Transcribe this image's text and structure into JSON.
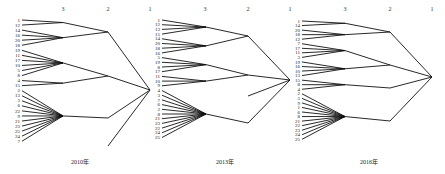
{
  "chart_data": {
    "type": "dendrogram",
    "level_labels": [
      "3",
      "2",
      "1"
    ],
    "panels": [
      {
        "caption": "2010年",
        "leaf_labels": [
          "1",
          "12",
          "14",
          "16",
          "20",
          "18",
          "19",
          "11",
          "17",
          "10",
          "5",
          "8",
          "4",
          "15",
          "2",
          "13",
          "3",
          "6",
          "22",
          "9",
          "21",
          "23",
          "25",
          "24",
          "7"
        ],
        "clusters_level3": [
          {
            "leaves": [
              "1",
              "12"
            ]
          },
          {
            "leaves": [
              "14",
              "16",
              "20",
              "18"
            ]
          },
          {
            "leaves": [
              "19",
              "11",
              "17",
              "10",
              "5",
              "8"
            ]
          },
          {
            "leaves": [
              "4",
              "15"
            ]
          },
          {
            "leaves": [
              "2",
              "13",
              "3",
              "6",
              "22",
              "9",
              "21",
              "23",
              "25",
              "24",
              "7"
            ]
          }
        ],
        "clusters_level2": [
          {
            "children": [
              0,
              1
            ]
          },
          {
            "children": [
              2,
              3
            ]
          },
          {
            "children": [
              4
            ]
          },
          {
            "children": [
              "stray"
            ]
          }
        ]
      },
      {
        "caption": "2013年",
        "leaf_labels": [
          "1",
          "12",
          "13",
          "15",
          "14",
          "20",
          "18",
          "16",
          "5",
          "19",
          "8",
          "17",
          "11",
          "10",
          "9",
          "4",
          "3",
          "7",
          "6",
          "2",
          "8",
          "21",
          "23",
          "22",
          "24",
          "25"
        ],
        "clusters_level3": [
          {
            "leaves": [
              "1",
              "12",
              "13",
              "15"
            ]
          },
          {
            "leaves": [
              "14",
              "20",
              "18",
              "16"
            ]
          },
          {
            "leaves": [
              "5",
              "19",
              "8",
              "17"
            ]
          },
          {
            "leaves": [
              "11",
              "10",
              "9"
            ]
          },
          {
            "leaves": [
              "4",
              "3",
              "7",
              "6",
              "2",
              "8",
              "21",
              "23",
              "22",
              "24",
              "25"
            ]
          }
        ]
      },
      {
        "caption": "2016年",
        "leaf_labels": [
          "1",
          "14",
          "20",
          "18",
          "12",
          "7",
          "17",
          "11",
          "3",
          "19",
          "16",
          "10",
          "13",
          "15",
          "8",
          "4",
          "2",
          "5",
          "9",
          "1",
          "6",
          "8",
          "21",
          "22",
          "23",
          "24",
          "25"
        ],
        "clusters_level3": [
          {
            "leaves": [
              "1",
              "14"
            ]
          },
          {
            "leaves": [
              "20",
              "18",
              "12"
            ]
          },
          {
            "leaves": [
              "7",
              "17",
              "11",
              "3"
            ]
          },
          {
            "leaves": [
              "19",
              "16",
              "10",
              "13"
            ]
          },
          {
            "leaves": [
              "15",
              "8",
              "4"
            ]
          },
          {
            "leaves": [
              "2",
              "5",
              "9",
              "1",
              "6",
              "8",
              "21",
              "22",
              "23",
              "24",
              "25"
            ]
          }
        ]
      }
    ]
  },
  "panels": [
    {
      "caption": "2010年",
      "h3": "3",
      "h2": "2",
      "h1": "1"
    },
    {
      "caption": "2013年",
      "h3": "3",
      "h2": "2",
      "h1": "1"
    },
    {
      "caption": "2016年",
      "h3": "3",
      "h2": "2",
      "h1": "1"
    }
  ]
}
